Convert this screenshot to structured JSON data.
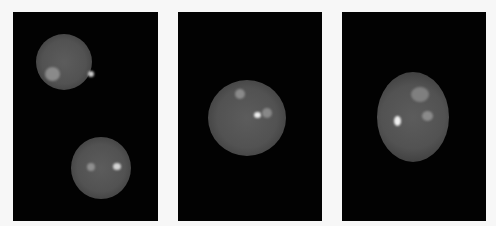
{
  "figure": {
    "background": "#f7f7f7",
    "panels": [
      {
        "id": "panel-1",
        "description": "Two nuclei with fluorescent foci",
        "cells": [
          {
            "x": 23,
            "y": 22,
            "w": 56,
            "h": 56
          },
          {
            "x": 58,
            "y": 125,
            "w": 60,
            "h": 62
          }
        ],
        "spots": [
          {
            "x": 32,
            "y": 55,
            "w": 15,
            "h": 14,
            "color": "#8a8a8a"
          },
          {
            "x": 75,
            "y": 59,
            "w": 6,
            "h": 6,
            "color": "#c9c9c9"
          },
          {
            "x": 74,
            "y": 151,
            "w": 8,
            "h": 8,
            "color": "#8f8f8f"
          },
          {
            "x": 100,
            "y": 151,
            "w": 8,
            "h": 7,
            "color": "#d4d4d4"
          }
        ]
      },
      {
        "id": "panel-2",
        "description": "Single nucleus with three foci",
        "cells": [
          {
            "x": 30,
            "y": 68,
            "w": 78,
            "h": 76
          }
        ],
        "spots": [
          {
            "x": 57,
            "y": 77,
            "w": 10,
            "h": 10,
            "color": "#8a8a8a"
          },
          {
            "x": 76,
            "y": 100,
            "w": 7,
            "h": 6,
            "color": "#ededed"
          },
          {
            "x": 84,
            "y": 96,
            "w": 10,
            "h": 10,
            "color": "#888888"
          }
        ]
      },
      {
        "id": "panel-3",
        "description": "Oval nucleus with bright focus and ring-like focus",
        "cells": [
          {
            "x": 35,
            "y": 60,
            "w": 72,
            "h": 90
          }
        ],
        "spots": [
          {
            "x": 69,
            "y": 75,
            "w": 18,
            "h": 15,
            "color": "#7f7f7f"
          },
          {
            "x": 52,
            "y": 104,
            "w": 7,
            "h": 10,
            "color": "#f0f0f0"
          },
          {
            "x": 80,
            "y": 99,
            "w": 11,
            "h": 10,
            "color": "#8a8a8a"
          }
        ]
      }
    ]
  }
}
